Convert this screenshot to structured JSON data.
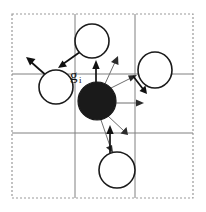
{
  "figure": {
    "caption": "",
    "canvas": {
      "width": 206,
      "height": 212,
      "background": "#ffffff"
    },
    "labels": [
      {
        "id": "gi",
        "base": "g",
        "subscript": "i",
        "x": 74,
        "y": 77,
        "color": "#111111"
      }
    ],
    "colors": {
      "grid_line": "#808080",
      "outer_border": "#9a9a9a",
      "circle_stroke": "#1a1a1a",
      "circle_fill": "#ffffff",
      "center_fill": "#1a1a1a",
      "arrow_bold": "#111111",
      "arrow_thin": "#6e6e6e"
    },
    "border": {
      "x": 12,
      "y": 14,
      "width": 181,
      "height": 184,
      "style": "dashed"
    },
    "grid": {
      "vertical_x": [
        75,
        135
      ],
      "horizontal_y": [
        74,
        133
      ],
      "style": "solid"
    },
    "nodes": [
      {
        "id": "center",
        "kind": "filled",
        "cx": 97,
        "cy": 101,
        "r": 19
      },
      {
        "id": "top",
        "kind": "open",
        "cx": 92,
        "cy": 41,
        "rx": 17,
        "ry": 17
      },
      {
        "id": "left",
        "kind": "open",
        "cx": 56,
        "cy": 87,
        "rx": 17,
        "ry": 17
      },
      {
        "id": "right",
        "kind": "open",
        "cx": 155,
        "cy": 70,
        "rx": 17,
        "ry": 18
      },
      {
        "id": "bottom",
        "kind": "open",
        "cx": 117,
        "cy": 170,
        "rx": 18,
        "ry": 18
      }
    ],
    "arrows": [
      {
        "id": "arrow-up-gi",
        "weight": "bold",
        "x1": 96,
        "y1": 92,
        "x2": 96,
        "y2": 62
      },
      {
        "id": "arrow-top-downleft",
        "weight": "bold",
        "x1": 80,
        "y1": 52,
        "x2": 60,
        "y2": 66
      },
      {
        "id": "arrow-left-upleft",
        "weight": "bold",
        "x1": 48,
        "y1": 77,
        "x2": 27,
        "y2": 58
      },
      {
        "id": "arrow-bottom-up",
        "weight": "bold",
        "x1": 110,
        "y1": 157,
        "x2": 110,
        "y2": 127
      },
      {
        "id": "arrow-right-down",
        "weight": "bold",
        "x1": 133,
        "y1": 76,
        "x2": 145,
        "y2": 92
      },
      {
        "id": "arrow-center-ne",
        "weight": "thin",
        "x1": 107,
        "y1": 90,
        "x2": 136,
        "y2": 76
      },
      {
        "id": "arrow-center-upne",
        "weight": "thin",
        "x1": 104,
        "y1": 86,
        "x2": 117,
        "y2": 57
      },
      {
        "id": "arrow-center-east",
        "weight": "thin",
        "x1": 113,
        "y1": 103,
        "x2": 143,
        "y2": 103
      },
      {
        "id": "arrow-center-se",
        "weight": "thin",
        "x1": 108,
        "y1": 116,
        "x2": 127,
        "y2": 134
      },
      {
        "id": "arrow-center-down",
        "weight": "thin",
        "x1": 101,
        "y1": 120,
        "x2": 112,
        "y2": 152
      }
    ]
  }
}
